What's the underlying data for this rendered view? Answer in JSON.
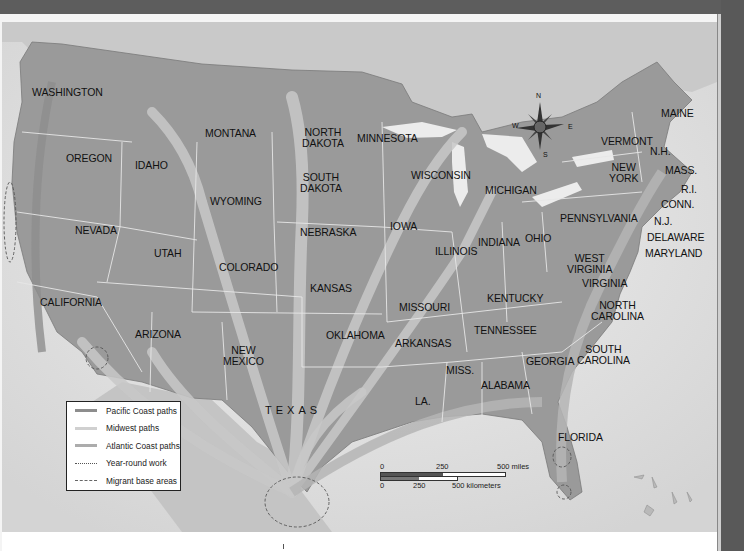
{
  "map": {
    "title": "",
    "region": "Contiguous United States",
    "theme": "Migrant farmworker paths"
  },
  "states": [
    {
      "name": "WASHINGTON",
      "x": 32,
      "y": 87
    },
    {
      "name": "OREGON",
      "x": 66,
      "y": 153
    },
    {
      "name": "IDAHO",
      "x": 135,
      "y": 160
    },
    {
      "name": "MONTANA",
      "x": 205,
      "y": 128
    },
    {
      "name": "NORTH DAKOTA",
      "line1": "NORTH",
      "line2": "DAKOTA",
      "x": 302,
      "y": 127
    },
    {
      "name": "MINNESOTA",
      "x": 357,
      "y": 133
    },
    {
      "name": "SOUTH DAKOTA",
      "line1": "SOUTH",
      "line2": "DAKOTA",
      "x": 300,
      "y": 172
    },
    {
      "name": "WISCONSIN",
      "x": 411,
      "y": 170
    },
    {
      "name": "MICHIGAN",
      "x": 485,
      "y": 185
    },
    {
      "name": "WYOMING",
      "x": 210,
      "y": 196
    },
    {
      "name": "NEBRASKA",
      "x": 300,
      "y": 227
    },
    {
      "name": "IOWA",
      "x": 390,
      "y": 221
    },
    {
      "name": "NEVADA",
      "x": 75,
      "y": 225
    },
    {
      "name": "UTAH",
      "x": 154,
      "y": 248
    },
    {
      "name": "COLORADO",
      "x": 219,
      "y": 262
    },
    {
      "name": "KANSAS",
      "x": 310,
      "y": 283
    },
    {
      "name": "ILLINOIS",
      "x": 435,
      "y": 246
    },
    {
      "name": "INDIANA",
      "x": 478,
      "y": 237
    },
    {
      "name": "OHIO",
      "x": 525,
      "y": 233
    },
    {
      "name": "PENNSYLVANIA",
      "x": 560,
      "y": 213
    },
    {
      "name": "WEST VIRGINIA",
      "line1": "WEST",
      "line2": "VIRGINIA",
      "x": 567,
      "y": 253
    },
    {
      "name": "VIRGINIA",
      "x": 582,
      "y": 278
    },
    {
      "name": "KENTUCKY",
      "x": 487,
      "y": 293
    },
    {
      "name": "MISSOURI",
      "x": 399,
      "y": 302
    },
    {
      "name": "CALIFORNIA",
      "x": 40,
      "y": 297
    },
    {
      "name": "ARIZONA",
      "x": 135,
      "y": 329
    },
    {
      "name": "NEW MEXICO",
      "line1": "NEW",
      "line2": "MEXICO",
      "x": 223,
      "y": 345
    },
    {
      "name": "OKLAHOMA",
      "x": 326,
      "y": 330
    },
    {
      "name": "ARKANSAS",
      "x": 395,
      "y": 338
    },
    {
      "name": "TENNESSEE",
      "x": 474,
      "y": 325
    },
    {
      "name": "NORTH CAROLINA",
      "line1": "NORTH",
      "line2": "CAROLINA",
      "x": 591,
      "y": 300
    },
    {
      "name": "SOUTH CAROLINA",
      "line1": "SOUTH",
      "line2": "CAROLINA",
      "x": 577,
      "y": 344
    },
    {
      "name": "GEORGIA",
      "x": 526,
      "y": 356
    },
    {
      "name": "MISS.",
      "x": 446,
      "y": 365
    },
    {
      "name": "ALABAMA",
      "x": 481,
      "y": 380
    },
    {
      "name": "LA.",
      "x": 415,
      "y": 396
    },
    {
      "name": "TEXAS",
      "x": 265,
      "y": 405
    },
    {
      "name": "FLORIDA",
      "x": 558,
      "y": 432
    },
    {
      "name": "MAINE",
      "x": 661,
      "y": 108
    },
    {
      "name": "VERMONT",
      "x": 601,
      "y": 136
    },
    {
      "name": "N.H.",
      "x": 650,
      "y": 146
    },
    {
      "name": "NEW YORK",
      "line1": "NEW",
      "line2": "YORK",
      "x": 609,
      "y": 162
    },
    {
      "name": "MASS.",
      "x": 665,
      "y": 165
    },
    {
      "name": "R.I.",
      "x": 681,
      "y": 184
    },
    {
      "name": "CONN.",
      "x": 661,
      "y": 199
    },
    {
      "name": "N.J.",
      "x": 654,
      "y": 216
    },
    {
      "name": "DELAWARE",
      "x": 647,
      "y": 232
    },
    {
      "name": "MARYLAND",
      "x": 645,
      "y": 248
    }
  ],
  "legend": {
    "items": [
      {
        "label": "Pacific Coast paths",
        "style": "solid",
        "color": "#8d8d8d"
      },
      {
        "label": "Midwest paths",
        "style": "solid",
        "color": "#cfcfcf"
      },
      {
        "label": "Atlantic Coast paths",
        "style": "solid",
        "color": "#ababab"
      },
      {
        "label": "Year-round work",
        "style": "dotted",
        "color": "#666666"
      },
      {
        "label": "Migrant base areas",
        "style": "dashed",
        "color": "#666666"
      }
    ]
  },
  "scale_bar": {
    "miles_labels": [
      "0",
      "250",
      "500 miles"
    ],
    "km_labels": [
      "0",
      "250",
      "500 kilometers"
    ]
  },
  "compass": {
    "n": "N",
    "e": "E",
    "s": "S",
    "w": "W"
  },
  "colors": {
    "land": "#9a9a9a",
    "land_dark": "#8a8a8a",
    "water": "#e6e6e6",
    "foreign_land": "#cdcdcd",
    "border": "#e8e8e8",
    "frame_dark": "#5a5a5a"
  }
}
